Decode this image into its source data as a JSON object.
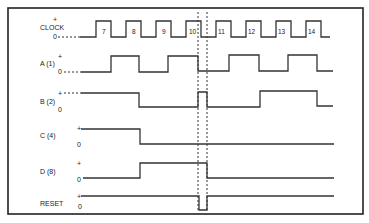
{
  "diagram": {
    "type": "timing-diagram",
    "signals": [
      {
        "name": "CLOCK",
        "plus_label": "+",
        "zero_label": "0",
        "pulses": [
          "7",
          "8",
          "9",
          "10",
          "11",
          "12",
          "13",
          "14"
        ]
      },
      {
        "name": "A (1)",
        "plus_label": "+",
        "zero_label": "0"
      },
      {
        "name": "B (2)",
        "plus_label": "+",
        "zero_label": "0"
      },
      {
        "name": "C (4)",
        "plus_label": "+",
        "zero_label": "0"
      },
      {
        "name": "D (8)",
        "plus_label": "+",
        "zero_label": "0"
      },
      {
        "name": "RESET",
        "plus_label": "+",
        "zero_label": "0"
      }
    ],
    "colors": {
      "line": "#333333",
      "background": "#ffffff"
    }
  }
}
